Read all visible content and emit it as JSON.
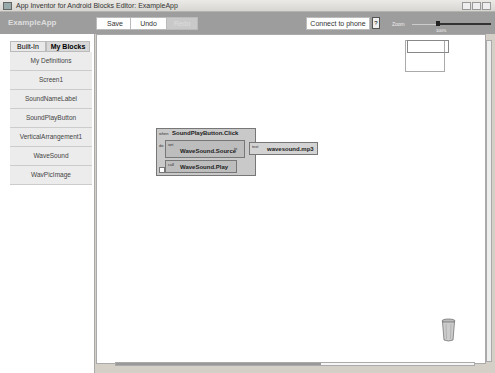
{
  "window": {
    "title": "App Inventor for Android Blocks Editor: ExampleApp"
  },
  "toolbar": {
    "app_name": "ExampleApp",
    "save": "Save",
    "undo": "Undo",
    "redo": "Redo",
    "connect": "Connect to phone",
    "phone_icon": "?",
    "zoom_label": "Zoom",
    "zoom_pct": "100%"
  },
  "sidebar": {
    "tabs": [
      {
        "label": "Built-In"
      },
      {
        "label": "My Blocks"
      }
    ],
    "items": [
      {
        "label": "My Definitions"
      },
      {
        "label": "Screen1"
      },
      {
        "label": "SoundNameLabel"
      },
      {
        "label": "SoundPlayButton"
      },
      {
        "label": "VerticalArrangement1"
      },
      {
        "label": "WaveSound"
      },
      {
        "label": "WavPicImage"
      }
    ]
  },
  "blocks": {
    "when": "when",
    "event": "SoundPlayButton.Click",
    "do": "do",
    "set": "set",
    "setter": "WaveSound.Source",
    "to": "to",
    "text": "text",
    "textval": "wavesound.mp3",
    "call": "call",
    "method": "WaveSound.Play"
  }
}
